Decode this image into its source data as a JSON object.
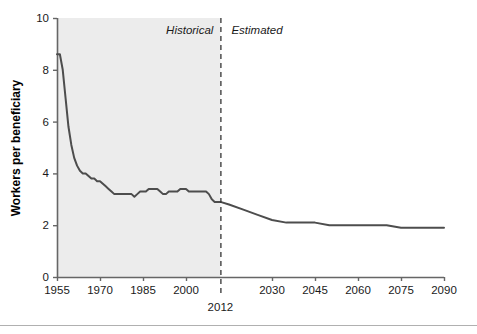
{
  "chart_data": {
    "type": "line",
    "title": "",
    "subtitle": "",
    "xlabel": "",
    "ylabel": "Workers per beneficiary",
    "xlim": [
      1955,
      2090
    ],
    "ylim": [
      0,
      10
    ],
    "grid": false,
    "legend_position": "none",
    "x_ticks": [
      1955,
      1970,
      1985,
      2000,
      2030,
      2045,
      2060,
      2075,
      2090
    ],
    "x_tick_labels": [
      "1955",
      "1970",
      "1985",
      "2000",
      "2030",
      "2045",
      "2060",
      "2075",
      "2090"
    ],
    "y_ticks": [
      0,
      2,
      4,
      6,
      8,
      10
    ],
    "y_tick_labels": [
      "0",
      "2",
      "4",
      "6",
      "8",
      "10"
    ],
    "annotations": [
      {
        "name": "historical-label",
        "text": "Historical",
        "x": 2000,
        "y": 9.4,
        "style": "italic"
      },
      {
        "name": "estimated-label",
        "text": "Estimated",
        "x": 2027,
        "y": 9.4,
        "style": "italic"
      },
      {
        "name": "divider-year-label",
        "text": "2012",
        "x": 2012,
        "y": -1.2,
        "style": "normal"
      }
    ],
    "divider": {
      "x": 2012,
      "label": "2012",
      "style": "dashed"
    },
    "shaded_region": {
      "x0": 1955,
      "x1": 2012,
      "color": "#ececec",
      "label": "Historical"
    },
    "series": [
      {
        "name": "Workers per beneficiary",
        "color": "#4d4d4d",
        "x": [
          1955,
          1956,
          1957,
          1958,
          1959,
          1960,
          1961,
          1962,
          1963,
          1964,
          1965,
          1966,
          1967,
          1968,
          1969,
          1970,
          1971,
          1972,
          1973,
          1974,
          1975,
          1976,
          1977,
          1978,
          1979,
          1980,
          1981,
          1982,
          1983,
          1984,
          1985,
          1986,
          1987,
          1988,
          1989,
          1990,
          1991,
          1992,
          1993,
          1994,
          1995,
          1996,
          1997,
          1998,
          1999,
          2000,
          2001,
          2002,
          2003,
          2004,
          2005,
          2006,
          2007,
          2008,
          2009,
          2010,
          2011,
          2012,
          2015,
          2020,
          2025,
          2030,
          2035,
          2040,
          2045,
          2050,
          2055,
          2060,
          2065,
          2070,
          2075,
          2080,
          2085,
          2090
        ],
        "y": [
          8.6,
          8.6,
          8.0,
          6.9,
          5.8,
          5.1,
          4.6,
          4.3,
          4.1,
          4.0,
          4.0,
          3.9,
          3.8,
          3.8,
          3.7,
          3.7,
          3.6,
          3.5,
          3.4,
          3.3,
          3.2,
          3.2,
          3.2,
          3.2,
          3.2,
          3.2,
          3.2,
          3.1,
          3.2,
          3.3,
          3.3,
          3.3,
          3.4,
          3.4,
          3.4,
          3.4,
          3.3,
          3.2,
          3.2,
          3.3,
          3.3,
          3.3,
          3.3,
          3.4,
          3.4,
          3.4,
          3.3,
          3.3,
          3.3,
          3.3,
          3.3,
          3.3,
          3.3,
          3.2,
          3.0,
          2.9,
          2.9,
          2.9,
          2.8,
          2.6,
          2.4,
          2.2,
          2.1,
          2.1,
          2.1,
          2.0,
          2.0,
          2.0,
          2.0,
          2.0,
          1.9,
          1.9,
          1.9,
          1.9
        ]
      }
    ]
  },
  "figure": {
    "background_color": "#ffffff",
    "line_color": "#4d4d4d",
    "shade_color": "#ececec",
    "axis_color": "#666666",
    "divider_color": "#333333",
    "footer_rule_color": "#b0b0b0"
  }
}
